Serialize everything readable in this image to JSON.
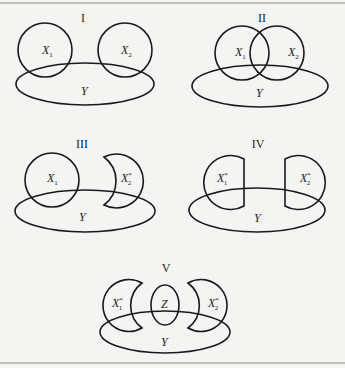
{
  "figure": {
    "panels": [
      {
        "id": "I",
        "label": "I",
        "sets": [
          "X",
          "X",
          "Y"
        ],
        "subs": [
          "1",
          "2"
        ],
        "sups": [
          "",
          ""
        ],
        "description": "Two disjoint circles X1 and X2, each overlapping ellipse Y"
      },
      {
        "id": "II",
        "label": "II",
        "sets": [
          "X",
          "X",
          "Y"
        ],
        "subs": [
          "1",
          "2"
        ],
        "sups": [
          "",
          ""
        ],
        "description": "Overlapping circles X1 and X2, both overlapping ellipse Y"
      },
      {
        "id": "III",
        "label": "III",
        "sets": [
          "X",
          "X",
          "Y"
        ],
        "subs": [
          "1",
          "2"
        ],
        "sups": [
          "",
          "*"
        ],
        "description": "Circle X1 and crescent X2* each overlapping ellipse Y"
      },
      {
        "id": "IV",
        "label": "IV",
        "sets": [
          "X",
          "X",
          "Y"
        ],
        "subs": [
          "1",
          "2"
        ],
        "sups": [
          "*",
          "*"
        ],
        "description": "Truncated circles X1* and X2* each overlapping ellipse Y"
      },
      {
        "id": "V",
        "label": "V",
        "sets": [
          "X",
          "Z",
          "X",
          "Y"
        ],
        "subs": [
          "1",
          "",
          "2"
        ],
        "sups": [
          "*",
          "",
          "*"
        ],
        "description": "Crescents X1* and X2* around ellipse Z, all overlapping ellipse Y"
      }
    ],
    "texts": {
      "I_x1": "X",
      "I_x1_sub": "1",
      "I_x2": "X",
      "I_x2_sub": "2",
      "I_y": "Y",
      "II_x1": "X",
      "II_x1_sub": "1",
      "II_x2": "X",
      "II_x2_sub": "2",
      "II_y": "Y",
      "III_x1": "X",
      "III_x1_sub": "1",
      "III_x2": "X",
      "III_x2_sub": "2",
      "III_x2_sup": "*",
      "III_y": "Y",
      "IV_x1": "X",
      "IV_x1_sub": "1",
      "IV_x1_sup": "*",
      "IV_x2": "X",
      "IV_x2_sub": "2",
      "IV_x2_sup": "*",
      "IV_y": "Y",
      "V_x1": "X",
      "V_x1_sub": "1",
      "V_x1_sup": "*",
      "V_z": "Z",
      "V_x2": "X",
      "V_x2_sub": "2",
      "V_x2_sup": "*",
      "V_y": "Y"
    },
    "colors": {
      "stroke": "#1a1a1a",
      "background": "#f4f4f2",
      "rule": "#8a8a8a"
    }
  }
}
